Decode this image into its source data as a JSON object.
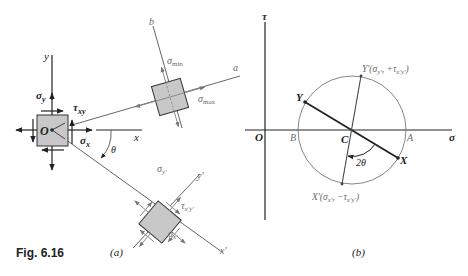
{
  "figure": {
    "caption": "Fig. 6.16",
    "subfig_a_label": "(a)",
    "subfig_b_label": "(b)"
  },
  "panel_a": {
    "axes": {
      "x": "x",
      "y": "y",
      "origin": "O",
      "x_prime": "x'",
      "y_prime": "y'",
      "a": "a",
      "b": "b"
    },
    "angle_label": "θ",
    "original_element": {
      "sigma_x": "σx",
      "sigma_y": "σy",
      "tau_xy": "τxy"
    },
    "principal_element": {
      "sigma_max": "σmax",
      "sigma_min": "σmin"
    },
    "rotated_element": {
      "sigma_x_prime": "σx'",
      "sigma_y_prime": "σy'",
      "tau_x_prime_y_prime": "τx'y'"
    }
  },
  "panel_b": {
    "axes": {
      "horizontal": "σ",
      "vertical": "τ",
      "origin": "O"
    },
    "points": {
      "A": "A",
      "B": "B",
      "C": "C",
      "X": "X",
      "Y": "Y",
      "X_prime": "X'(σx', −τx'y')",
      "Y_prime": "Y'(σy', +τx'y')"
    },
    "angle_label": "2θ"
  }
}
